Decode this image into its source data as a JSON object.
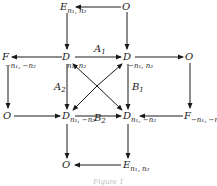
{
  "diagram": {
    "nodes": [
      {
        "id": "top-E",
        "letter": "E",
        "sub": "n₁, n₂",
        "x": 60,
        "y": 2
      },
      {
        "id": "top-O",
        "letter": "O",
        "sub": "",
        "x": 122,
        "y": 2
      },
      {
        "id": "mid1-F",
        "letter": "F",
        "sub": "−n₁, −n₂",
        "x": 2,
        "y": 52
      },
      {
        "id": "mid1-D-left",
        "letter": "D",
        "sub": "n₁, n₂",
        "x": 62,
        "y": 52
      },
      {
        "id": "mid1-D-right",
        "letter": "D",
        "sub": "−n₁, n₂",
        "x": 123,
        "y": 52
      },
      {
        "id": "mid1-O",
        "letter": "O",
        "sub": "",
        "x": 185,
        "y": 52
      },
      {
        "id": "mid2-O",
        "letter": "O",
        "sub": "",
        "x": 3,
        "y": 111
      },
      {
        "id": "mid2-D-left",
        "letter": "D",
        "sub": "n₁, −n₂",
        "x": 62,
        "y": 111
      },
      {
        "id": "mid2-D-right",
        "letter": "D",
        "sub": "n₁, −n₂",
        "x": 123,
        "y": 111
      },
      {
        "id": "mid2-F",
        "letter": "F",
        "sub": "−n₁, −n₂",
        "x": 184,
        "y": 111
      },
      {
        "id": "bot-O",
        "letter": "O",
        "sub": "",
        "x": 62,
        "y": 160
      },
      {
        "id": "bot-E",
        "letter": "E",
        "sub": "n₁, n₂",
        "x": 123,
        "y": 160
      }
    ],
    "edge_labels": [
      {
        "id": "A1",
        "letter": "A",
        "sub": "1",
        "x": 94,
        "y": 44
      },
      {
        "id": "A2",
        "letter": "A",
        "sub": "2",
        "x": 54,
        "y": 82
      },
      {
        "id": "B1",
        "letter": "B",
        "sub": "1",
        "x": 132,
        "y": 82
      },
      {
        "id": "B2",
        "letter": "B",
        "sub": "2",
        "x": 94,
        "y": 113
      }
    ],
    "caption": "Figure 1"
  }
}
